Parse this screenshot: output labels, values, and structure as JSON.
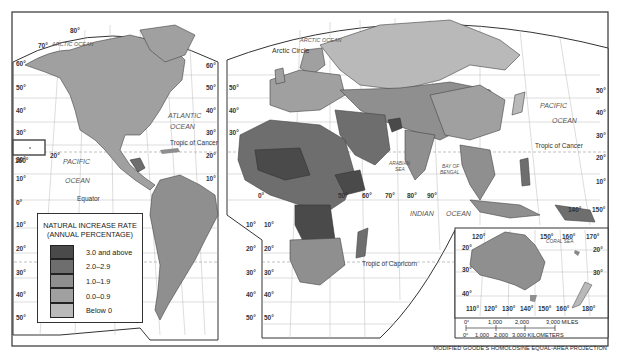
{
  "legend": {
    "title_line1": "NATURAL INCREASE RATE",
    "title_line2": "(ANNUAL PERCENTAGE)",
    "classes": [
      {
        "label": "3.0 and above",
        "color": "#4a4a4a"
      },
      {
        "label": "2.0–2.9",
        "color": "#6e6e6e"
      },
      {
        "label": "1.0–1.9",
        "color": "#8f8f8f"
      },
      {
        "label": "0.0–0.9",
        "color": "#a0a0a0"
      },
      {
        "label": "Below 0",
        "color": "#b9b9b9"
      }
    ]
  },
  "labels": {
    "arctic_ocean_west": "ARCTIC OCEAN",
    "arctic_ocean_east": "ARCTIC OCEAN",
    "arctic_circle": "Arctic Circle",
    "atlantic_1": "ATLANTIC",
    "atlantic_2": "OCEAN",
    "pacific_west_1": "PACIFIC",
    "pacific_west_2": "OCEAN",
    "pacific_east_1": "PACIFIC",
    "pacific_east_2": "OCEAN",
    "indian_1": "INDIAN",
    "indian_2": "OCEAN",
    "arabian_1": "ARABIAN",
    "arabian_2": "SEA",
    "bengal_1": "BAY OF",
    "bengal_2": "BENGAL",
    "coral_sea": "CORAL SEA",
    "equator": "Equator",
    "tropic_cancer_west": "Tropic of Cancer",
    "tropic_cancer_east": "Tropic of Cancer",
    "tropic_capricorn": "Tropic of Capricorn"
  },
  "degrees": {
    "lat_left": [
      "60°",
      "50°",
      "40°",
      "30°",
      "20°",
      "10°",
      "0°",
      "10°",
      "20°",
      "30°",
      "40°",
      "50°"
    ],
    "lat_mid_left": [
      "60°",
      "50°",
      "40°",
      "30°",
      "20°",
      "10°"
    ],
    "lat_mid_right": [
      "50°",
      "40°",
      "30°",
      "10°",
      "20°",
      "30°",
      "40°",
      "50°"
    ],
    "lat_right": [
      "50°",
      "40°",
      "30°",
      "20°",
      "10°"
    ],
    "lon_mid": [
      "0°",
      "50°",
      "60°",
      "70°",
      "80°",
      "90°",
      "140°",
      "150°"
    ],
    "top": [
      "80°",
      "70°",
      "160°",
      "20°"
    ],
    "inset_top": [
      "120°",
      "150°",
      "160°",
      "170°"
    ],
    "inset_side": [
      "20°",
      "30°",
      "40°",
      "20°",
      "30°"
    ],
    "inset_bottom": [
      "110°",
      "120°",
      "130°",
      "140°",
      "150°",
      "160°",
      "180°"
    ],
    "south_africa": [
      "10°",
      "20°",
      "30°",
      "40°",
      "50°",
      "10°",
      "20°",
      "30°",
      "40°",
      "50°"
    ]
  },
  "scale": {
    "miles": [
      "0°",
      "1,000",
      "2,000",
      "3,000 MILES"
    ],
    "km": [
      "0°",
      "1,000",
      "2,000",
      "3,000 KILOMETERS"
    ]
  },
  "footer": "MODIFIED GOODE'S HOMOLOSINE EQUAL-AREA PROJECTION"
}
